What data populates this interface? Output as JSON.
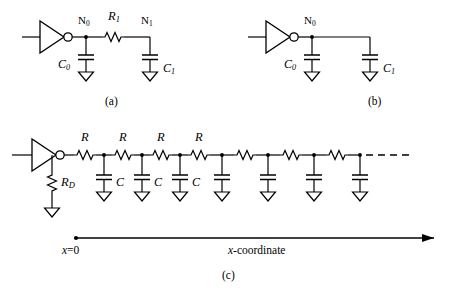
{
  "figure": {
    "kind": "circuit-diagram",
    "line_color": "#000000",
    "background": "#ffffff",
    "subfigures": [
      {
        "id": "a",
        "caption": "(a)",
        "description": "inverter driving node N0 with C0 to ground, series resistor R1 to node N1 with C1 to ground",
        "labels": {
          "node0": "N",
          "node0_sub": "0",
          "node1": "N",
          "node1_sub": "1",
          "resistor": "R",
          "resistor_sub": "1",
          "cap0": "C",
          "cap0_sub": "0",
          "cap1": "C",
          "cap1_sub": "1"
        }
      },
      {
        "id": "b",
        "caption": "(b)",
        "description": "inverter driving node N0 with C0 and C1 both to ground, no series resistor",
        "labels": {
          "node0": "N",
          "node0_sub": "0",
          "cap0": "C",
          "cap0_sub": "0",
          "cap1": "C",
          "cap1_sub": "1"
        }
      },
      {
        "id": "c",
        "caption": "(c)",
        "description": "inverter with driver resistance RD to ground, driving a distributed RC ladder of seven R sections and seven shunt C capacitors, continuing as a dashed line",
        "labels": {
          "driver_resistor": "R",
          "driver_resistor_sub": "D",
          "ladder_resistors": [
            "R",
            "R",
            "R",
            "R",
            "",
            "",
            ""
          ],
          "ladder_capacitors": [
            "C",
            "C",
            "C",
            "",
            "",
            "",
            ""
          ]
        },
        "axis": {
          "origin_label_x": "x",
          "origin_label_eq": "=0",
          "axis_label_x": "x",
          "axis_label_rest": "-coordinate"
        }
      }
    ]
  }
}
